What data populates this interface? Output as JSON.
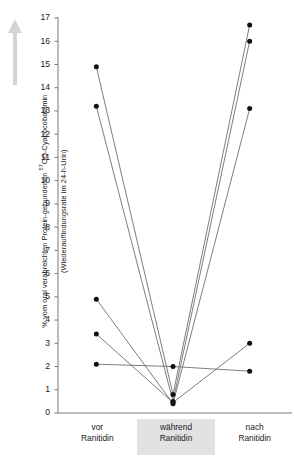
{
  "axis": {
    "y_label_line1": "% vom oral verabreichten Protein-gebundenen ",
    "y_label_sup": "57",
    "y_label_line1b": "CO-Cyanocobalamin",
    "y_label_line2": "(Wiederauffindungsrate im 24-h-Urin)",
    "arrow_icon": "up-arrow-icon",
    "tick_labels": [
      "0",
      "1",
      "2",
      "3",
      "4",
      "5",
      "6",
      "7",
      "8",
      "9",
      "10",
      "11",
      "12",
      "13",
      "14",
      "15",
      "16",
      "17"
    ]
  },
  "categories": [
    {
      "line1": "vor",
      "line2": "Ranitidin",
      "highlight": false
    },
    {
      "line1": "während",
      "line2": "Ranitidin",
      "highlight": true
    },
    {
      "line1": "nach",
      "line2": "Ranitidin",
      "highlight": false
    }
  ],
  "colors": {
    "line": "#6e6e6e",
    "marker": "#111111",
    "axis": "#7a7a7a",
    "highlight_band": "#e2e2e2",
    "arrow": "#d4d4d4"
  },
  "chart_data": {
    "type": "line",
    "title": "",
    "xlabel": "",
    "ylabel": "% vom oral verabreichten Protein-gebundenen 57CO-Cyanocobalamin (Wiederauffindungsrate im 24-h-Urin)",
    "categories": [
      "vor Ranitidin",
      "während Ranitidin",
      "nach Ranitidin"
    ],
    "ylim": [
      0,
      17
    ],
    "ytick_step": 1,
    "grid": false,
    "legend": "none",
    "note": "Paired individual subject profiles; each line connects one subject across the three timepoints.",
    "series": [
      {
        "name": "Subjekt 1",
        "values": [
          14.9,
          0.8,
          16.7
        ]
      },
      {
        "name": "Subjekt 2",
        "values": [
          13.2,
          0.5,
          16.0
        ]
      },
      {
        "name": "Subjekt 3",
        "values": [
          4.9,
          0.4,
          13.1
        ]
      },
      {
        "name": "Subjekt 4",
        "values": [
          3.4,
          0.45,
          3.0
        ]
      },
      {
        "name": "Subjekt 5",
        "values": [
          2.1,
          2.0,
          1.8
        ]
      }
    ]
  }
}
